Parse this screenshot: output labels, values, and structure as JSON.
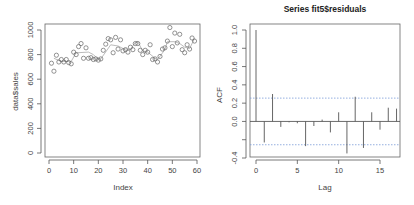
{
  "chart_data": [
    {
      "type": "scatter",
      "title": "",
      "xlabel": "Index",
      "ylabel": "data$sales",
      "xlim": [
        0,
        60
      ],
      "ylim": [
        0,
        1000
      ],
      "x_ticks": [
        0,
        10,
        20,
        30,
        40,
        50,
        60
      ],
      "y_ticks": [
        0,
        200,
        400,
        600,
        800,
        1000
      ],
      "grid": false,
      "series": [
        {
          "name": "data$sales",
          "marker": "open-circle",
          "x": [
            1,
            2,
            3,
            4,
            5,
            6,
            7,
            8,
            9,
            10,
            11,
            12,
            13,
            14,
            15,
            16,
            17,
            18,
            19,
            20,
            21,
            22,
            23,
            24,
            25,
            26,
            27,
            28,
            29,
            30,
            31,
            32,
            33,
            34,
            35,
            36,
            37,
            38,
            39,
            40,
            41,
            42,
            43,
            44,
            45,
            46,
            47,
            48,
            49,
            50,
            51,
            52,
            53,
            54,
            55,
            56,
            57,
            58,
            59
          ],
          "y": [
            730,
            665,
            795,
            740,
            760,
            740,
            760,
            735,
            725,
            820,
            800,
            865,
            890,
            770,
            855,
            770,
            775,
            760,
            765,
            755,
            765,
            835,
            885,
            930,
            920,
            815,
            940,
            845,
            920,
            830,
            840,
            820,
            860,
            840,
            890,
            890,
            835,
            800,
            835,
            820,
            880,
            760,
            765,
            740,
            785,
            845,
            855,
            910,
            1020,
            865,
            975,
            895,
            965,
            840,
            815,
            880,
            845,
            935,
            910
          ]
        },
        {
          "name": "fitted",
          "marker": "line",
          "x": [
            2,
            5,
            9,
            11,
            16,
            18,
            20,
            21,
            25,
            28,
            30,
            33,
            35,
            36,
            38,
            40,
            43,
            44,
            47,
            48,
            51,
            53,
            55,
            57,
            59
          ],
          "y": [
            770,
            745,
            745,
            815,
            820,
            800,
            760,
            765,
            880,
            870,
            850,
            840,
            900,
            905,
            830,
            820,
            770,
            760,
            840,
            905,
            905,
            890,
            860,
            850,
            930
          ]
        }
      ]
    },
    {
      "type": "bar",
      "title": "Series  fit5$residuals",
      "xlabel": "Lag",
      "ylabel": "ACF",
      "xlim": [
        0,
        17
      ],
      "ylim": [
        -0.4,
        1.0
      ],
      "x_ticks": [
        0,
        5,
        10,
        15
      ],
      "y_ticks": [
        -0.4,
        -0.2,
        0.0,
        0.2,
        0.4,
        0.6,
        0.8,
        1.0
      ],
      "y_tick_labels": [
        "-0.4",
        "",
        "0.0",
        "0.2",
        "0.4",
        "0.6",
        "0.8",
        "1.0"
      ],
      "grid": false,
      "categories": [
        0,
        1,
        2,
        3,
        4,
        5,
        6,
        7,
        8,
        9,
        10,
        11,
        12,
        13,
        14,
        15,
        16,
        17
      ],
      "values": [
        1.0,
        -0.23,
        0.3,
        -0.06,
        -0.01,
        -0.02,
        -0.27,
        -0.05,
        0.02,
        -0.12,
        0.1,
        -0.35,
        0.27,
        -0.29,
        0.1,
        -0.09,
        0.15,
        0.14
      ],
      "confidence_bounds": [
        -0.255,
        0.255
      ]
    }
  ]
}
